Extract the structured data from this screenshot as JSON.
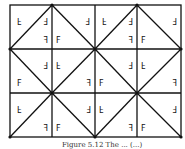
{
  "diagram": {
    "grid": {
      "cols": 4,
      "rows": 3,
      "x": [
        10,
        52,
        95,
        137,
        181
      ],
      "y": [
        5,
        49,
        93,
        137
      ]
    },
    "motif_letter": "F",
    "line_color": "#111111",
    "background": "#ffffff"
  },
  "caption": {
    "text": "Figure 5.12 The ... (...)"
  }
}
